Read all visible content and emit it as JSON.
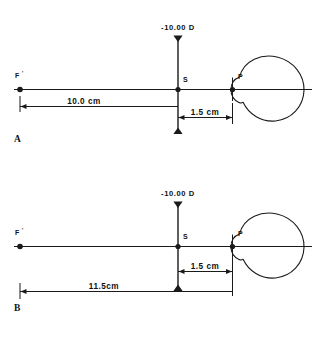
{
  "figure": {
    "line_color": "#1a1a1a",
    "background": "#ffffff",
    "panels": [
      {
        "id": "A",
        "panel_label": "A",
        "lens_power_label": "-10.00 D",
        "lens_vertex_label": "S",
        "focal_point_label": "F",
        "focal_point_prime": "'",
        "eye_point_label": "P",
        "dimensions": [
          {
            "name": "focal-length",
            "value_label": "10.0 cm",
            "from": "F'",
            "to": "S"
          },
          {
            "name": "vertex-distance",
            "value_label": "1.5 cm",
            "from": "S",
            "to": "P"
          }
        ]
      },
      {
        "id": "B",
        "panel_label": "B",
        "lens_power_label": "-10.00 D",
        "lens_vertex_label": "S",
        "focal_point_label": "F",
        "focal_point_prime": "'",
        "eye_point_label": "P",
        "dimensions": [
          {
            "name": "vertex-distance",
            "value_label": "1.5 cm",
            "from": "S",
            "to": "P"
          },
          {
            "name": "focal-point-to-cornea",
            "value_label": "11.5cm",
            "from": "F'",
            "to": "P"
          }
        ]
      }
    ]
  }
}
